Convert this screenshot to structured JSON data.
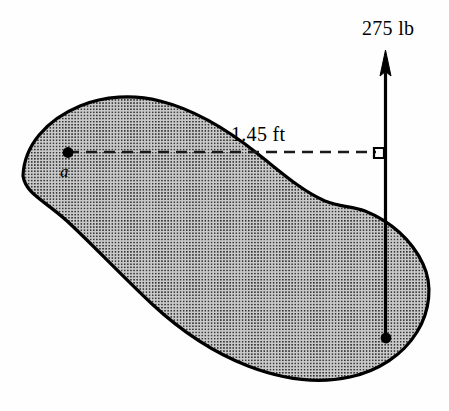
{
  "figure": {
    "background_color": "#fefefe",
    "body": {
      "name": "irregular rigid body",
      "fill_color": "#c8c8c8",
      "stipple_dot_color": "#2b2b2b",
      "outline_color": "#000000",
      "outline_width": 3
    },
    "point_a": {
      "label": "a",
      "x": 68,
      "y": 153,
      "marker_color": "#000000"
    },
    "force": {
      "label": "275 lb",
      "magnitude": "275",
      "units": "lb",
      "direction": "up",
      "color": "#000000",
      "line_x": 385,
      "tip_y": 52,
      "tail_y": 338,
      "application_point": {
        "x": 386,
        "y": 338
      }
    },
    "moment_arm": {
      "label": "1.45 ft",
      "value": "1.45",
      "units": "ft",
      "line_style": "dashed",
      "color": "#1a1a1a",
      "from_x": 68,
      "to_x": 374,
      "y": 152
    },
    "right_angle_marker": {
      "name": "perpendicular marker",
      "x": 374,
      "y": 148,
      "size": 10,
      "color": "#000000"
    }
  }
}
